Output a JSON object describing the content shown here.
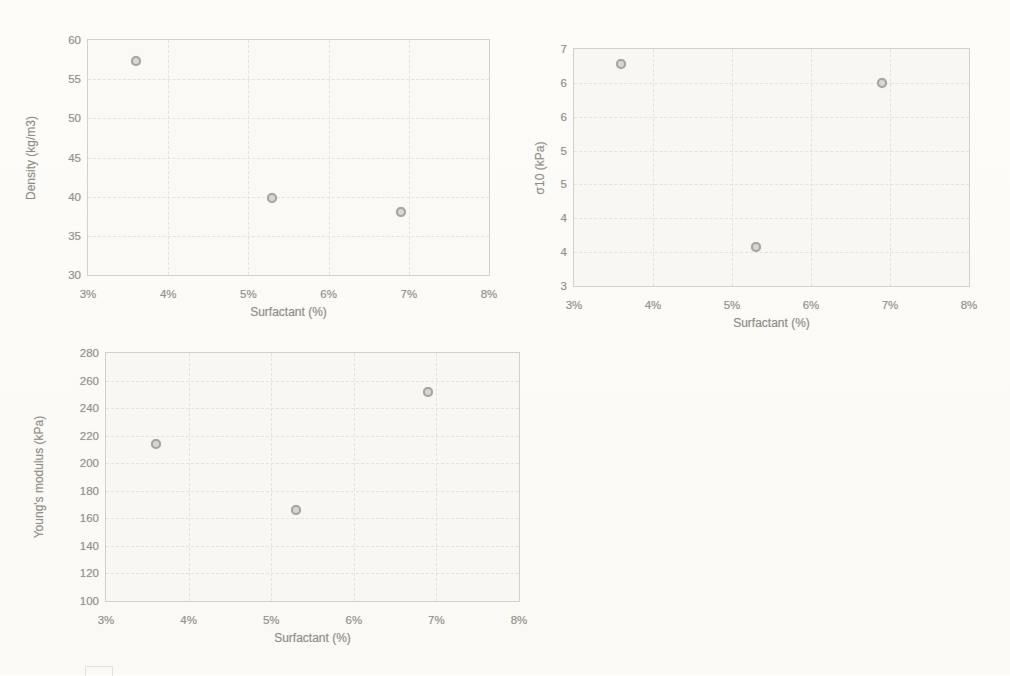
{
  "page": {
    "background": "#fbfaf6"
  },
  "style": {
    "marker_border": "#a6a59f",
    "marker_fill": "#d7d6d0",
    "gridline_color": "#e4e3dd",
    "axis_text_color": "#93928c",
    "plot_border_color": "#d2d1cb"
  },
  "chart_data": [
    {
      "type": "scatter",
      "name": "density-vs-surfactant",
      "title": "",
      "xlabel": "Surfactant (%)",
      "ylabel": "Density (kg/m3)",
      "xlim": [
        3,
        8
      ],
      "ylim": [
        30,
        60
      ],
      "grid": true,
      "legend": "none",
      "x_ticks": [
        {
          "v": 3,
          "label": "3%"
        },
        {
          "v": 4,
          "label": "4%"
        },
        {
          "v": 5,
          "label": "5%"
        },
        {
          "v": 6,
          "label": "6%"
        },
        {
          "v": 7,
          "label": "7%"
        },
        {
          "v": 8,
          "label": "8%"
        }
      ],
      "y_ticks": [
        {
          "v": 60,
          "label": "60"
        },
        {
          "v": 55,
          "label": "55"
        },
        {
          "v": 50,
          "label": "50"
        },
        {
          "v": 45,
          "label": "45"
        },
        {
          "v": 40,
          "label": "40"
        },
        {
          "v": 35,
          "label": "35"
        },
        {
          "v": 30,
          "label": "30"
        }
      ],
      "points": [
        {
          "x": 3.6,
          "y": 57.3
        },
        {
          "x": 5.3,
          "y": 39.8
        },
        {
          "x": 6.9,
          "y": 38.1
        }
      ]
    },
    {
      "type": "scatter",
      "name": "sigma10-vs-surfactant",
      "title": "",
      "xlabel": "Surfactant (%)",
      "ylabel": "σ10 (kPa)",
      "xlim": [
        3,
        8
      ],
      "ylim": [
        3,
        7
      ],
      "grid": true,
      "legend": "none",
      "x_ticks": [
        {
          "v": 3,
          "label": "3%"
        },
        {
          "v": 4,
          "label": "4%"
        },
        {
          "v": 5,
          "label": "5%"
        },
        {
          "v": 6,
          "label": "6%"
        },
        {
          "v": 7,
          "label": "7%"
        },
        {
          "v": 8,
          "label": "8%"
        }
      ],
      "y_ticks": [
        {
          "v": 7.0,
          "label": "7"
        },
        {
          "v": 6.4286,
          "label": "6"
        },
        {
          "v": 5.8571,
          "label": "6"
        },
        {
          "v": 5.2857,
          "label": "5"
        },
        {
          "v": 4.7143,
          "label": "5"
        },
        {
          "v": 4.1429,
          "label": "4"
        },
        {
          "v": 3.5714,
          "label": "4"
        },
        {
          "v": 3.0,
          "label": "3"
        }
      ],
      "points": [
        {
          "x": 3.6,
          "y": 6.75
        },
        {
          "x": 5.3,
          "y": 3.65
        },
        {
          "x": 6.9,
          "y": 6.43
        }
      ]
    },
    {
      "type": "scatter",
      "name": "youngs-modulus-vs-surfactant",
      "title": "",
      "xlabel": "Surfactant (%)",
      "ylabel": "Young's modulus (kPa)",
      "xlim": [
        3,
        8
      ],
      "ylim": [
        100,
        280
      ],
      "grid": true,
      "legend": "none",
      "x_ticks": [
        {
          "v": 3,
          "label": "3%"
        },
        {
          "v": 4,
          "label": "4%"
        },
        {
          "v": 5,
          "label": "5%"
        },
        {
          "v": 6,
          "label": "6%"
        },
        {
          "v": 7,
          "label": "7%"
        },
        {
          "v": 8,
          "label": "8%"
        }
      ],
      "y_ticks": [
        {
          "v": 280,
          "label": "280"
        },
        {
          "v": 260,
          "label": "260"
        },
        {
          "v": 240,
          "label": "240"
        },
        {
          "v": 220,
          "label": "220"
        },
        {
          "v": 200,
          "label": "200"
        },
        {
          "v": 180,
          "label": "180"
        },
        {
          "v": 160,
          "label": "160"
        },
        {
          "v": 140,
          "label": "140"
        },
        {
          "v": 120,
          "label": "120"
        },
        {
          "v": 100,
          "label": "100"
        }
      ],
      "points": [
        {
          "x": 3.6,
          "y": 214
        },
        {
          "x": 5.3,
          "y": 166
        },
        {
          "x": 6.9,
          "y": 252
        }
      ]
    }
  ]
}
